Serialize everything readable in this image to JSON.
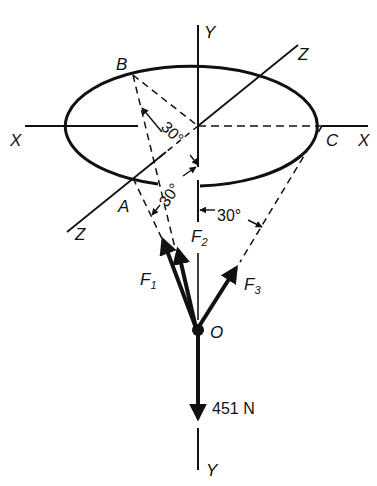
{
  "diagram": {
    "type": "3D force system (cone of three cables)",
    "axes": {
      "x_left": "X",
      "x_right": "X",
      "y_top": "Y",
      "y_bottom": "Y",
      "z_top": "Z",
      "z_bottom": "Z"
    },
    "points": {
      "a": "A",
      "b": "B",
      "c": "C",
      "o": "O"
    },
    "forces": {
      "f1": "F",
      "f1_sub": "1",
      "f2": "F",
      "f2_sub": "2",
      "f3": "F",
      "f3_sub": "3"
    },
    "load": "451 N",
    "angles": {
      "ob": "30°",
      "oa": "30°",
      "oc": "30°"
    }
  }
}
